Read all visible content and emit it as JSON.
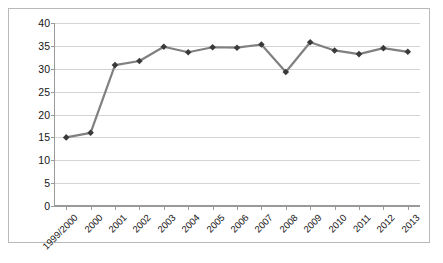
{
  "chart_data": {
    "type": "line",
    "title": "",
    "subtitle": "",
    "xlabel": "",
    "ylabel": "",
    "categories": [
      "1999/2000",
      "2000",
      "2001",
      "2002",
      "2003",
      "2004",
      "2005",
      "2006",
      "2007",
      "2008",
      "2009",
      "2010",
      "2011",
      "2012",
      "2013"
    ],
    "series": [
      {
        "name": "",
        "values": [
          15.0,
          16.0,
          30.8,
          31.7,
          34.8,
          33.6,
          34.7,
          34.6,
          35.3,
          29.3,
          35.8,
          34.0,
          33.2,
          34.5,
          33.7
        ]
      }
    ],
    "ylim": [
      0,
      40
    ],
    "ytick_values": [
      0,
      5,
      10,
      15,
      20,
      25,
      30,
      35,
      40
    ],
    "ytick_labels": [
      "0",
      "5",
      "10",
      "15",
      "20",
      "25",
      "30",
      "35",
      "40"
    ],
    "grid": "horizontal",
    "legend": "none",
    "marker": "diamond",
    "colors": {
      "line": "#808080",
      "marker": "#3a3a3a",
      "gridline": "#d4d4d4",
      "axis": "#9a9a9a",
      "border": "#b9b9b9",
      "text": "#151515",
      "background": "#ffffff"
    }
  }
}
